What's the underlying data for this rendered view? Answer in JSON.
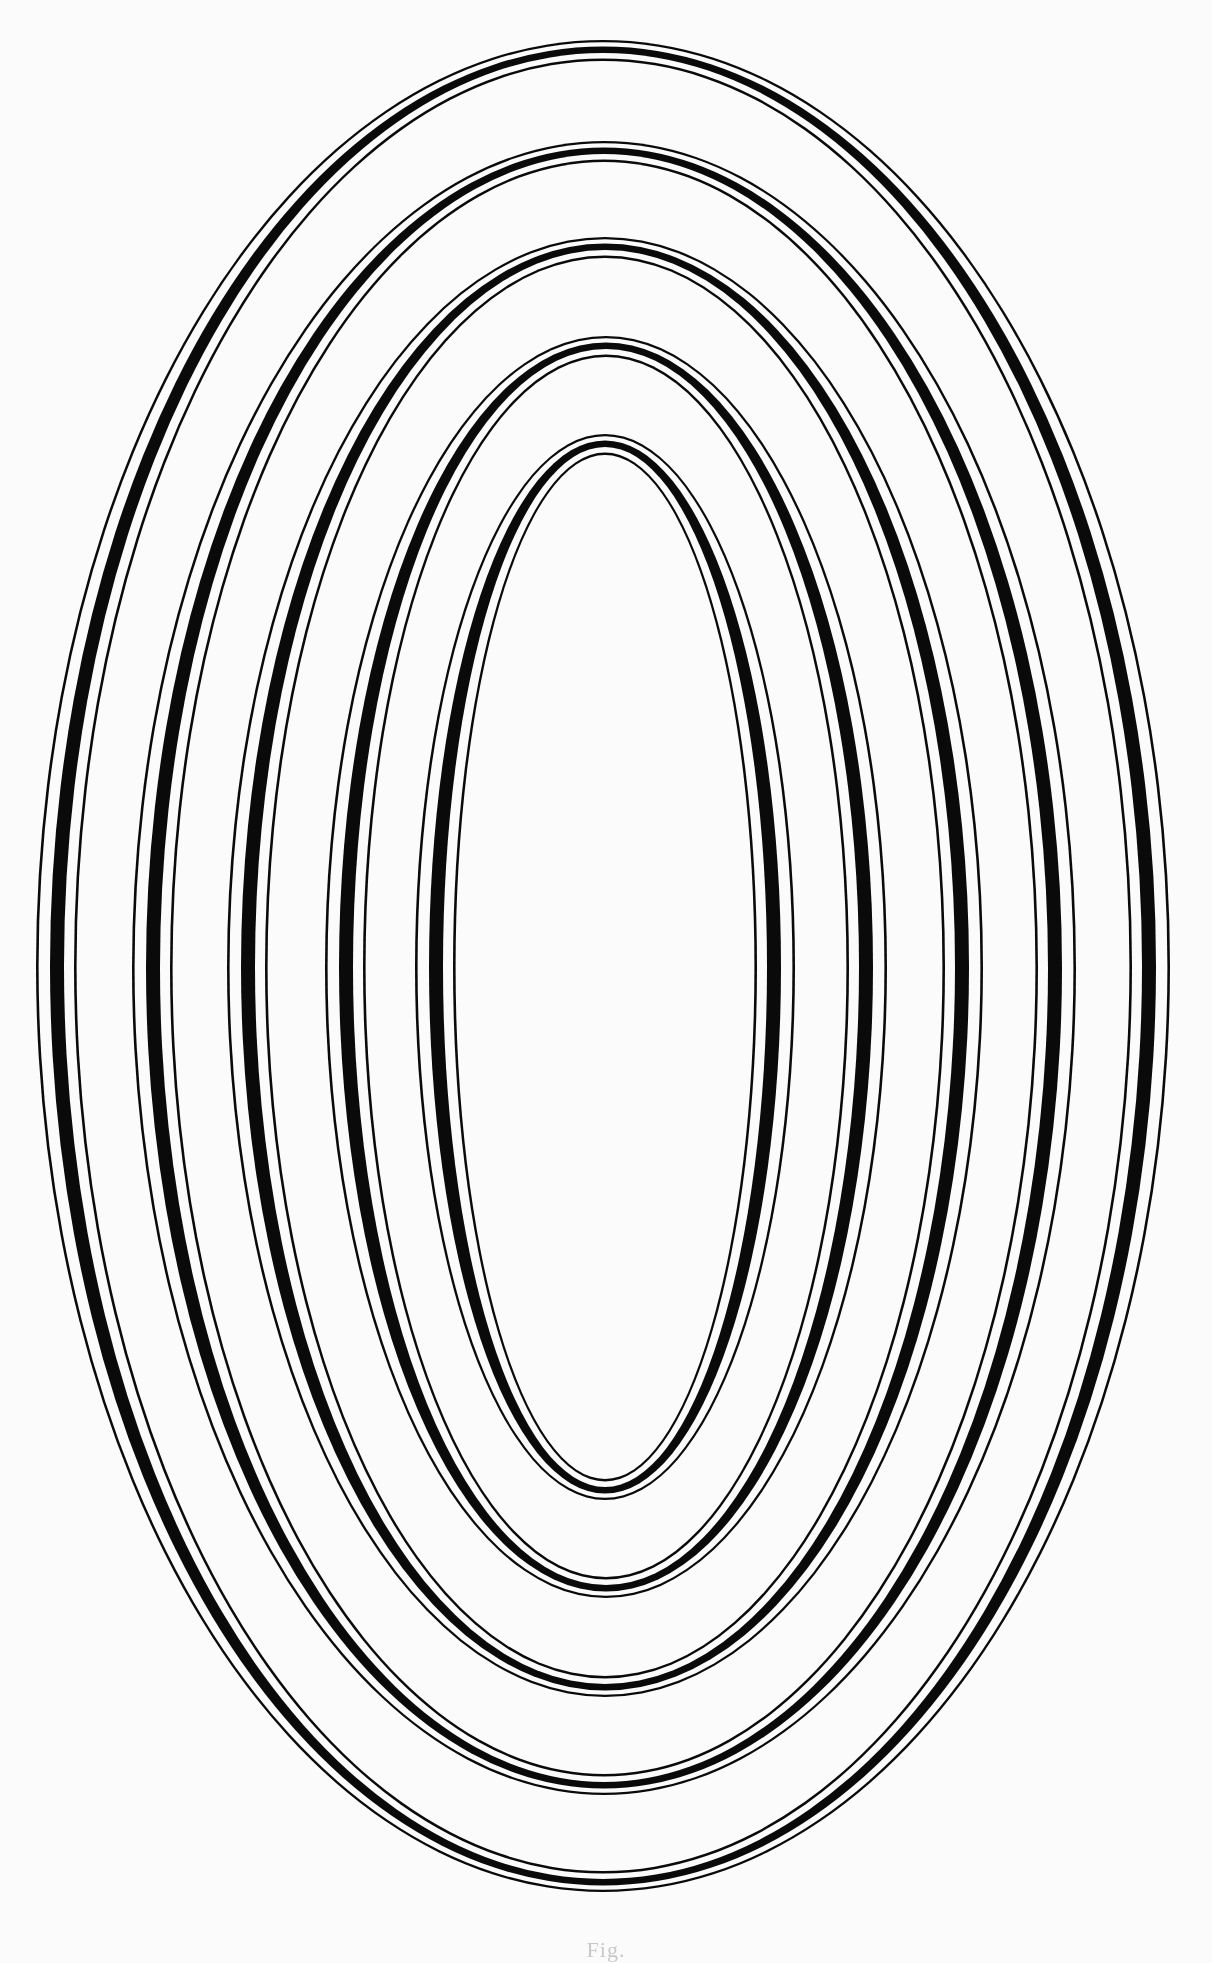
{
  "page": {
    "background": "#fbfbfb",
    "ink": "#0a0a0a"
  },
  "figure": {
    "rings": [
      {
        "cx": 603,
        "cy": 966,
        "rx": 567,
        "ry": 926
      },
      {
        "cx": 604,
        "cy": 968,
        "rx": 472,
        "ry": 827
      },
      {
        "cx": 605,
        "cy": 967,
        "rx": 378,
        "ry": 730
      },
      {
        "cx": 606,
        "cy": 967,
        "rx": 281,
        "ry": 631
      },
      {
        "cx": 605,
        "cy": 967,
        "rx": 190,
        "ry": 533
      }
    ],
    "band_insets_side": [
      0,
      2.6,
      14,
      28,
      38,
      40.6
    ],
    "band_insets_top": [
      0,
      2.2,
      6.5,
      13,
      18.5,
      21
    ]
  },
  "caption": {
    "text": "Fig."
  }
}
